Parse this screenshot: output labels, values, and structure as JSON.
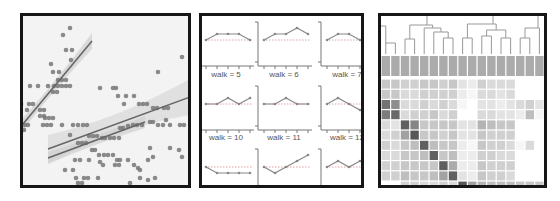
{
  "chart_data": [
    {
      "type": "scatter",
      "title": "",
      "xlabel": "",
      "ylabel": "",
      "grid": false,
      "legend": null,
      "marker_color": "#777777",
      "line_color": "#666666",
      "band_color": "#cfcfcf",
      "points": [
        [
          70,
          28
        ],
        [
          63,
          35
        ],
        [
          66,
          50
        ],
        [
          72,
          50
        ],
        [
          51,
          64
        ],
        [
          71,
          60
        ],
        [
          53,
          72
        ],
        [
          59,
          72
        ],
        [
          58,
          80
        ],
        [
          62,
          80
        ],
        [
          66,
          80
        ],
        [
          30,
          86
        ],
        [
          38,
          86
        ],
        [
          48,
          86
        ],
        [
          54,
          86
        ],
        [
          58,
          86
        ],
        [
          62,
          86
        ],
        [
          66,
          86
        ],
        [
          70,
          86
        ],
        [
          53,
          92
        ],
        [
          57,
          92
        ],
        [
          21,
          104
        ],
        [
          29,
          104
        ],
        [
          33,
          104
        ],
        [
          27,
          110
        ],
        [
          40,
          110
        ],
        [
          44,
          110
        ],
        [
          40,
          116
        ],
        [
          44,
          116
        ],
        [
          45,
          118
        ],
        [
          49,
          118
        ],
        [
          53,
          118
        ],
        [
          25,
          125
        ],
        [
          28,
          125
        ],
        [
          43,
          125
        ],
        [
          47,
          125
        ],
        [
          51,
          125
        ],
        [
          24,
          130
        ],
        [
          62,
          125
        ],
        [
          73,
          125
        ],
        [
          78,
          125
        ],
        [
          83,
          125
        ],
        [
          87,
          125
        ],
        [
          89,
          136
        ],
        [
          93,
          136
        ],
        [
          97,
          136
        ],
        [
          102,
          138
        ],
        [
          105,
          138
        ],
        [
          110,
          138
        ],
        [
          114,
          138
        ],
        [
          119,
          138
        ],
        [
          120,
          128
        ],
        [
          123,
          128
        ],
        [
          128,
          126
        ],
        [
          133,
          125
        ],
        [
          137,
          125
        ],
        [
          142,
          125
        ],
        [
          150,
          122
        ],
        [
          153,
          122
        ],
        [
          158,
          125
        ],
        [
          163,
          125
        ],
        [
          166,
          120
        ],
        [
          170,
          125
        ],
        [
          180,
          125
        ],
        [
          184,
          125
        ],
        [
          100,
          88
        ],
        [
          113,
          88
        ],
        [
          116,
          88
        ],
        [
          118,
          96
        ],
        [
          124,
          104
        ],
        [
          126,
          96
        ],
        [
          134,
          96
        ],
        [
          139,
          104
        ],
        [
          143,
          104
        ],
        [
          147,
          104
        ],
        [
          153,
          108
        ],
        [
          157,
          108
        ],
        [
          164,
          108
        ],
        [
          168,
          108
        ],
        [
          70,
          135
        ],
        [
          78,
          143
        ],
        [
          82,
          143
        ],
        [
          86,
          143
        ],
        [
          92,
          150
        ],
        [
          95,
          150
        ],
        [
          99,
          155
        ],
        [
          104,
          155
        ],
        [
          108,
          155
        ],
        [
          113,
          155
        ],
        [
          117,
          160
        ],
        [
          120,
          160
        ],
        [
          75,
          160
        ],
        [
          80,
          160
        ],
        [
          89,
          160
        ],
        [
          100,
          162
        ],
        [
          103,
          165
        ],
        [
          128,
          160
        ],
        [
          148,
          160
        ],
        [
          153,
          157
        ],
        [
          150,
          148
        ],
        [
          170,
          148
        ],
        [
          179,
          150
        ],
        [
          182,
          157
        ],
        [
          65,
          170
        ],
        [
          73,
          170
        ],
        [
          76,
          178
        ],
        [
          84,
          178
        ],
        [
          88,
          178
        ],
        [
          98,
          178
        ],
        [
          115,
          165
        ],
        [
          119,
          165
        ],
        [
          134,
          165
        ],
        [
          138,
          168
        ],
        [
          140,
          170
        ],
        [
          140,
          178
        ],
        [
          148,
          180
        ],
        [
          155,
          178
        ],
        [
          78,
          183
        ],
        [
          82,
          183
        ],
        [
          115,
          188
        ],
        [
          130,
          183
        ],
        [
          31,
          190
        ],
        [
          54,
          190
        ],
        [
          78,
          190
        ],
        [
          117,
          190
        ],
        [
          102,
          202
        ],
        [
          110,
          200
        ],
        [
          182,
          57
        ],
        [
          158,
          72
        ]
      ],
      "fits": [
        {
          "x0": 23,
          "y0": 124,
          "x1": 92,
          "y1": 41,
          "band_halfwidth": [
            6,
            3,
            8
          ]
        },
        {
          "x0": 48,
          "y0": 149,
          "x1": 190,
          "y1": 97,
          "band_halfwidth": [
            14,
            4,
            18
          ]
        },
        {
          "x0": 48,
          "y0": 158,
          "x1": 145,
          "y1": 122,
          "band_halfwidth": [
            6,
            3,
            6
          ]
        }
      ]
    },
    {
      "type": "line",
      "title": "",
      "layout": "facet grid (3 columns, partially cropped)",
      "reference_line": "dotted horizontal baseline",
      "facets": [
        {
          "label": "",
          "values": [
            0,
            1,
            1,
            1,
            0
          ]
        },
        {
          "label": "",
          "values": [
            0,
            1,
            1,
            2,
            1
          ]
        },
        {
          "label": "",
          "values": [
            0,
            1,
            1,
            0,
            -1
          ]
        },
        {
          "label": "walk = 5",
          "values": [
            0,
            0,
            1,
            0,
            1
          ]
        },
        {
          "label": "walk = 6",
          "values": [
            0,
            0,
            1,
            0,
            0
          ]
        },
        {
          "label": "walk = 7",
          "values": [
            0,
            1,
            0,
            -1,
            0
          ]
        },
        {
          "label": "walk = 10",
          "values": [
            0,
            -1,
            -1,
            -1,
            -1
          ]
        },
        {
          "label": "walk = 11",
          "values": [
            0,
            -1,
            0,
            1,
            2
          ]
        },
        {
          "label": "walk = 12",
          "values": [
            0,
            1,
            0,
            1,
            2
          ]
        }
      ]
    },
    {
      "type": "heatmap",
      "title": "",
      "dendrogram": "top (columns)",
      "n_cols": 17,
      "n_rows": 11,
      "color_range": [
        "#ffffff",
        "#444444"
      ],
      "header_row_shade": 0.45,
      "values": [
        [
          0.3,
          0.3,
          0.25,
          0.25,
          0.3,
          0.3,
          0.25,
          0.3,
          0.15,
          0.1,
          0.25,
          0.2,
          0.2,
          0.2,
          0.0,
          0.0,
          0.0
        ],
        [
          0.3,
          0.3,
          0.2,
          0.2,
          0.25,
          0.25,
          0.25,
          0.25,
          0.1,
          0.05,
          0.2,
          0.2,
          0.15,
          0.2,
          0.0,
          0.0,
          0.0
        ],
        [
          0.75,
          0.6,
          0.2,
          0.2,
          0.25,
          0.2,
          0.25,
          0.2,
          0.05,
          0.0,
          0.15,
          0.15,
          0.1,
          0.15,
          0.2,
          0.25,
          0.15
        ],
        [
          0.7,
          0.8,
          0.2,
          0.25,
          0.25,
          0.3,
          0.2,
          0.25,
          0.0,
          0.0,
          0.2,
          0.2,
          0.15,
          0.15,
          0.1,
          0.35,
          0.05
        ],
        [
          0.2,
          0.15,
          0.85,
          0.65,
          0.3,
          0.3,
          0.3,
          0.3,
          0.15,
          0.15,
          0.4,
          0.35,
          0.3,
          0.3,
          0.0,
          0.0,
          0.0
        ],
        [
          0.2,
          0.25,
          0.5,
          0.9,
          0.3,
          0.3,
          0.25,
          0.3,
          0.15,
          0.15,
          0.3,
          0.25,
          0.25,
          0.25,
          0.0,
          0.0,
          0.0
        ],
        [
          0.25,
          0.2,
          0.3,
          0.35,
          0.85,
          0.35,
          0.3,
          0.3,
          0.1,
          0.05,
          0.3,
          0.25,
          0.25,
          0.2,
          0.05,
          0.2,
          0.0
        ],
        [
          0.2,
          0.2,
          0.3,
          0.3,
          0.35,
          0.85,
          0.3,
          0.35,
          0.1,
          0.1,
          0.25,
          0.25,
          0.2,
          0.2,
          0.0,
          0.0,
          0.0
        ],
        [
          0.25,
          0.25,
          0.3,
          0.3,
          0.3,
          0.3,
          0.85,
          0.45,
          0.1,
          0.1,
          0.3,
          0.25,
          0.25,
          0.25,
          0.0,
          0.0,
          0.0
        ],
        [
          0.25,
          0.25,
          0.35,
          0.3,
          0.3,
          0.35,
          0.5,
          0.85,
          0.15,
          0.1,
          0.3,
          0.25,
          0.25,
          0.2,
          0.0,
          0.0,
          0.0
        ],
        [
          0.0,
          0.0,
          0.25,
          0.25,
          0.2,
          0.2,
          0.25,
          0.2,
          0.9,
          0.5,
          0.4,
          0.35,
          0.35,
          0.35,
          0.3,
          0.3,
          0.3
        ]
      ]
    }
  ]
}
